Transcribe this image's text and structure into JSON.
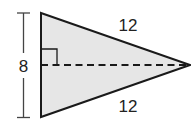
{
  "diagram": {
    "type": "isosceles triangle with altitude",
    "labels": {
      "height": "8",
      "top_side": "12",
      "bottom_side": "12"
    },
    "colors": {
      "fill": "#e6e6e6",
      "stroke": "#1a1a1a",
      "text": "#222222"
    }
  }
}
